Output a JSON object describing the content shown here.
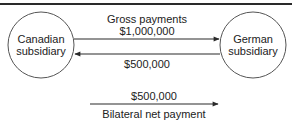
{
  "diagram": {
    "nodes": {
      "left": {
        "line1": "Canadian",
        "line2": "subsidiary"
      },
      "right": {
        "line1": "German",
        "line2": "subsidiary"
      }
    },
    "gross": {
      "title": "Gross payments",
      "forward_amount": "$1,000,000",
      "reverse_amount": "$500,000"
    },
    "net": {
      "amount": "$500,000",
      "label": "Bilateral net payment"
    },
    "colors": {
      "line": "#2a2a2a",
      "text": "#222222"
    }
  }
}
